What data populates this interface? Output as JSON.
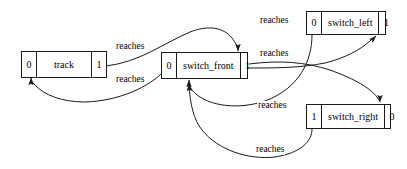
{
  "diagram": {
    "type": "graph",
    "title": "",
    "nodes": [
      {
        "id": "track",
        "left_port": "0",
        "label": "track",
        "right_port": "1"
      },
      {
        "id": "switch_front",
        "left_port": "0",
        "label": "switch_front",
        "right_port": "1"
      },
      {
        "id": "switch_left",
        "left_port": "0",
        "label": "switch_left",
        "right_port": "1"
      },
      {
        "id": "switch_right",
        "left_port": "1",
        "label": "switch_right",
        "right_port": "0"
      }
    ],
    "edge_labels": [
      {
        "id": "track-to-front",
        "text": "reaches"
      },
      {
        "id": "front-to-track",
        "text": "reaches"
      },
      {
        "id": "left-to-front",
        "text": "reaches"
      },
      {
        "id": "front-to-left",
        "text": "reaches"
      },
      {
        "id": "right-to-front",
        "text": "reaches"
      },
      {
        "id": "front-to-right",
        "text": "reaches"
      }
    ]
  }
}
